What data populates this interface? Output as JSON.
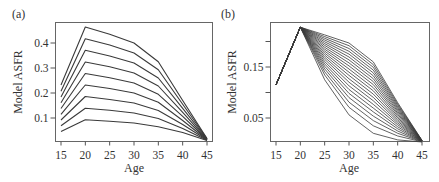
{
  "chart_data": [
    {
      "panel": "(a)",
      "type": "line",
      "title": "",
      "xlabel": "Age",
      "ylabel": "Model ASFR",
      "x": [
        15,
        20,
        25,
        30,
        35,
        40,
        45
      ],
      "xticks": [
        "15",
        "20",
        "25",
        "30",
        "35",
        "40",
        "45"
      ],
      "yticks": [
        "0.1",
        "0.2",
        "0.3",
        "0.4"
      ],
      "ytick_values": [
        0.1,
        0.2,
        0.3,
        0.4
      ],
      "xlim": [
        14,
        46.5
      ],
      "ylim": [
        0.0,
        0.48
      ],
      "grid": false,
      "legend": null,
      "series": [
        {
          "name": "curve-1",
          "values": [
            0.232,
            0.464,
            0.435,
            0.4,
            0.325,
            0.17,
            0.018
          ]
        },
        {
          "name": "curve-2",
          "values": [
            0.207,
            0.417,
            0.392,
            0.36,
            0.293,
            0.155,
            0.017
          ]
        },
        {
          "name": "curve-3",
          "values": [
            0.184,
            0.371,
            0.348,
            0.32,
            0.26,
            0.139,
            0.016
          ]
        },
        {
          "name": "curve-4",
          "values": [
            0.161,
            0.324,
            0.305,
            0.28,
            0.228,
            0.123,
            0.015
          ]
        },
        {
          "name": "curve-5",
          "values": [
            0.138,
            0.278,
            0.261,
            0.24,
            0.195,
            0.107,
            0.014
          ]
        },
        {
          "name": "curve-6",
          "values": [
            0.115,
            0.232,
            0.218,
            0.2,
            0.163,
            0.09,
            0.013
          ]
        },
        {
          "name": "curve-7",
          "values": [
            0.092,
            0.186,
            0.174,
            0.16,
            0.13,
            0.074,
            0.012
          ]
        },
        {
          "name": "curve-8",
          "values": [
            0.069,
            0.139,
            0.131,
            0.12,
            0.098,
            0.058,
            0.011
          ]
        },
        {
          "name": "curve-9",
          "values": [
            0.046,
            0.093,
            0.087,
            0.08,
            0.065,
            0.042,
            0.01
          ]
        }
      ]
    },
    {
      "panel": "(b)",
      "type": "line",
      "title": "",
      "xlabel": "Age",
      "ylabel": "Model ASFR",
      "x": [
        15,
        20,
        25,
        30,
        35,
        40,
        45
      ],
      "xticks": [
        "15",
        "20",
        "25",
        "30",
        "35",
        "40",
        "45"
      ],
      "yticks": [
        "0.05",
        "",
        "0.15",
        ""
      ],
      "ytick_values": [
        0.05,
        0.1,
        0.15,
        0.2
      ],
      "xlim": [
        14,
        46.5
      ],
      "ylim": [
        -0.004,
        0.236
      ],
      "grid": false,
      "legend": null,
      "n_curves": 21,
      "outer_curve": [
        0.115,
        0.228,
        0.213,
        0.197,
        0.16,
        0.08,
        0.006
      ],
      "inner_curve": [
        0.115,
        0.228,
        0.125,
        0.056,
        0.02,
        0.007,
        0.003
      ]
    }
  ],
  "colors": {
    "line": "#3a3a3a",
    "axis": "#555555",
    "text": "#333333"
  }
}
